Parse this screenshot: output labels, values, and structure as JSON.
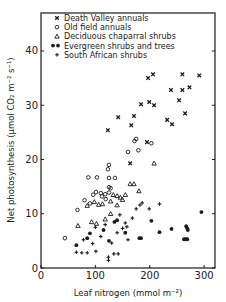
{
  "chart_data": {
    "type": "scatter",
    "title": "",
    "xlabel": "Leaf nitrogen (mmol m⁻²)",
    "ylabel": "Net photosynthesis (μmol CO₂ m⁻² s⁻¹)",
    "xlim": [
      0,
      320
    ],
    "ylim": [
      0,
      47
    ],
    "x_ticks": [
      0,
      100,
      200,
      300
    ],
    "x_tick_labels": [
      "0",
      "100",
      "200",
      "300"
    ],
    "y_ticks": [
      0,
      10,
      20,
      30,
      40
    ],
    "y_tick_labels": [
      "0",
      "10",
      "20",
      "30",
      "40"
    ],
    "grid": false,
    "legend_position": "top-left",
    "series": [
      {
        "name": "Death Valley annuals",
        "marker": "x",
        "points": [
          [
            197,
            35.0
          ],
          [
            206,
            35.7
          ],
          [
            260,
            35.7
          ],
          [
            291,
            35.5
          ],
          [
            239,
            32.8
          ],
          [
            260,
            32.8
          ],
          [
            273,
            33.3
          ],
          [
            254,
            30.9
          ],
          [
            184,
            30.2
          ],
          [
            199,
            30.6
          ],
          [
            208,
            30.0
          ],
          [
            265,
            28.5
          ],
          [
            232,
            27.3
          ],
          [
            241,
            26.5
          ],
          [
            142,
            27.8
          ],
          [
            171,
            28.0
          ],
          [
            166,
            26.3
          ],
          [
            123,
            25.4
          ],
          [
            195,
            23.2
          ],
          [
            164,
            19.3
          ]
        ]
      },
      {
        "name": "Old field annuals",
        "marker": "circle-open",
        "points": [
          [
            172,
            23.4
          ],
          [
            175,
            23.8
          ],
          [
            203,
            23.0
          ],
          [
            160,
            21.4
          ],
          [
            179,
            21.7
          ],
          [
            125,
            19.0
          ],
          [
            123,
            18.2
          ],
          [
            87,
            16.7
          ],
          [
            103,
            16.7
          ],
          [
            125,
            16.6
          ],
          [
            136,
            16.6
          ],
          [
            125,
            14.9
          ],
          [
            128,
            14.7
          ],
          [
            101,
            14.0
          ],
          [
            96,
            13.5
          ],
          [
            110,
            13.8
          ],
          [
            118,
            13.6
          ],
          [
            125,
            13.9
          ],
          [
            112,
            13.2
          ],
          [
            44,
            5.5
          ],
          [
            67,
            10.7
          ],
          [
            80,
            12.5
          ],
          [
            90,
            11.9
          ],
          [
            119,
            12.7
          ]
        ]
      },
      {
        "name": "Deciduous chaparral shrubs",
        "marker": "triangle-open",
        "points": [
          [
            208,
            19.3
          ],
          [
            164,
            15.5
          ],
          [
            171,
            15.5
          ],
          [
            180,
            14.2
          ],
          [
            133,
            13.5
          ],
          [
            140,
            13.3
          ],
          [
            146,
            13.0
          ],
          [
            150,
            12.6
          ],
          [
            155,
            13.5
          ],
          [
            98,
            12.2
          ],
          [
            106,
            11.7
          ],
          [
            113,
            11.8
          ],
          [
            128,
            12.3
          ],
          [
            140,
            11.6
          ],
          [
            68,
            7.8
          ],
          [
            93,
            8.5
          ],
          [
            102,
            8.2
          ],
          [
            118,
            9.0
          ],
          [
            128,
            10.0
          ],
          [
            85,
            11.5
          ]
        ]
      },
      {
        "name": "Evergreen shrubs and trees",
        "marker": "circle-filled",
        "points": [
          [
            295,
            10.3
          ],
          [
            203,
            8.7
          ],
          [
            218,
            6.6
          ],
          [
            240,
            7.2
          ],
          [
            267,
            7.7
          ],
          [
            269,
            7.3
          ],
          [
            270,
            7.0
          ],
          [
            263,
            5.3
          ],
          [
            266,
            5.3
          ],
          [
            269,
            5.3
          ],
          [
            181,
            5.5
          ],
          [
            184,
            5.5
          ],
          [
            65,
            4.2
          ],
          [
            90,
            6.4
          ],
          [
            85,
            5.5
          ],
          [
            125,
            5.0
          ],
          [
            135,
            8.5
          ],
          [
            140,
            8.8
          ],
          [
            115,
            7.0
          ],
          [
            155,
            6.5
          ]
        ]
      },
      {
        "name": "South African shrubs",
        "marker": "plus",
        "points": [
          [
            186,
            12.0
          ],
          [
            218,
            11.8
          ],
          [
            182,
            11.6
          ],
          [
            175,
            10.9
          ],
          [
            199,
            10.9
          ],
          [
            168,
            9.2
          ],
          [
            155,
            8.3
          ],
          [
            158,
            7.6
          ],
          [
            160,
            5.2
          ],
          [
            145,
            9.8
          ],
          [
            150,
            7.3
          ],
          [
            140,
            6.5
          ],
          [
            134,
            2.6
          ],
          [
            142,
            2.6
          ],
          [
            124,
            2.0
          ],
          [
            124,
            1.4
          ],
          [
            65,
            2.9
          ],
          [
            75,
            2.8
          ],
          [
            85,
            2.8
          ],
          [
            101,
            3.1
          ],
          [
            78,
            5.2
          ],
          [
            95,
            4.5
          ],
          [
            110,
            5.8
          ],
          [
            130,
            4.6
          ],
          [
            100,
            7.5
          ],
          [
            118,
            8.0
          ]
        ]
      }
    ]
  }
}
